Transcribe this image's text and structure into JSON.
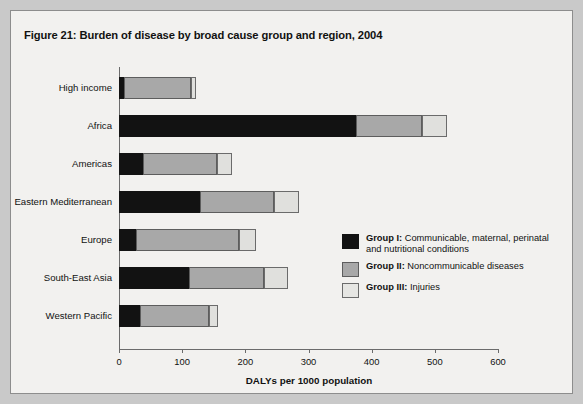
{
  "figure": {
    "title": "Figure 21: Burden of disease by broad cause group and region, 2004"
  },
  "legend": {
    "items": [
      {
        "key": "Group I:",
        "label": " Communicable, maternal, perinatal and nutritional conditions",
        "color": "#121212"
      },
      {
        "key": "Group II:",
        "label": " Noncommunicable diseases",
        "color": "#a8a8a8"
      },
      {
        "key": "Group III:",
        "label": " Injuries",
        "color": "#e6e6e3"
      }
    ]
  },
  "chart_data": {
    "type": "bar",
    "orientation": "horizontal",
    "stacked": true,
    "title": "Figure 21: Burden of disease by broad cause group and region, 2004",
    "xlabel": "DALYs per 1000 population",
    "ylabel": "",
    "xlim": [
      0,
      600
    ],
    "xticks": [
      0,
      100,
      200,
      300,
      400,
      500,
      600
    ],
    "grid": false,
    "legend_position": "inside-right",
    "categories": [
      "High income",
      "Africa",
      "Americas",
      "Eastern Mediterranean",
      "Europe",
      "South-East Asia",
      "Western Pacific"
    ],
    "series": [
      {
        "name": "Group I: Communicable, maternal, perinatal and nutritional conditions",
        "color": "#121212",
        "values": [
          8,
          375,
          38,
          128,
          27,
          111,
          33
        ]
      },
      {
        "name": "Group II: Noncommunicable diseases",
        "color": "#a8a8a8",
        "values": [
          106,
          104,
          117,
          117,
          163,
          119,
          109
        ]
      },
      {
        "name": "Group III: Injuries",
        "color": "#e0e0dd",
        "values": [
          8,
          41,
          24,
          40,
          27,
          38,
          15
        ]
      }
    ],
    "totals": [
      122,
      520,
      179,
      285,
      217,
      268,
      157
    ]
  }
}
